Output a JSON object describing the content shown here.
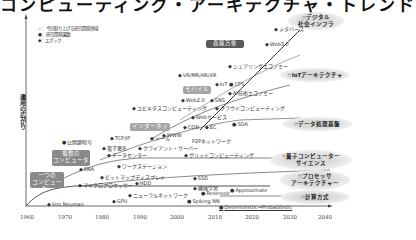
{
  "title": "コンピューティング・アーキテクチャ・トレンド",
  "legend": {
    "star": "☆：今回取り上げる研究開発領域",
    "circle": "●：研究開発課題",
    "diamond": "◆：エポック"
  },
  "yaxis_label": "適用の広がり",
  "xaxis_ticks": [
    "1960",
    "1970",
    "1980",
    "1990",
    "2000",
    "2010",
    "2020",
    "2030",
    "2040"
  ],
  "epoch_boxes": [
    {
      "label": "一つの\nコンピューター"
    },
    {
      "label": "複数の\nコンピューター"
    },
    {
      "label": "インターネット"
    },
    {
      "label": "モバイル"
    },
    {
      "label": "森羅万象"
    }
  ],
  "focus_areas": [
    {
      "label": "☆デジタル\n社会インフラ"
    },
    {
      "label": "☆IoTアーキテクチャ"
    },
    {
      "label": "☆データ処理基盤"
    },
    {
      "label": "☆量子コンピューター\nサイエンス"
    },
    {
      "label": "☆プロセッサ\nアーキテクチャー"
    },
    {
      "label": "☆計算方式"
    }
  ],
  "items": [
    {
      "label": "メタバース"
    },
    {
      "label": "Web3.0"
    },
    {
      "label": "シェアリングエコノミー"
    },
    {
      "label": "VR/MR/AR/XR"
    },
    {
      "label": "IoT"
    },
    {
      "label": "CPS"
    },
    {
      "label": "AI技術エコノミー"
    },
    {
      "label": "Web2.0"
    },
    {
      "label": "SNS"
    },
    {
      "label": "ユビキタスコンピューティング"
    },
    {
      "label": "クラウドコンピューティング"
    },
    {
      "label": "Webサービス"
    },
    {
      "label": "CDN"
    },
    {
      "label": "EC"
    },
    {
      "label": "SOA"
    },
    {
      "label": "WWW"
    },
    {
      "label": "P2Pネットワーク"
    },
    {
      "label": "公開鍵暗号"
    },
    {
      "label": "TCP/IP"
    },
    {
      "label": "メール"
    },
    {
      "label": "電子署名"
    },
    {
      "label": "データセンター"
    },
    {
      "label": "クライアント・サーバー"
    },
    {
      "label": "グリッドコンピューティング"
    },
    {
      "label": "SNA"
    },
    {
      "label": "ワークステーション"
    },
    {
      "label": "ビットマップディスプレイ"
    },
    {
      "label": "HDD"
    },
    {
      "label": "マイクロプロセッサー"
    },
    {
      "label": "ニューラルネットワーク"
    },
    {
      "label": "SSD"
    },
    {
      "label": "機械学習"
    },
    {
      "label": "Reservoir"
    },
    {
      "label": "Approximate"
    },
    {
      "label": "Von Neuman"
    },
    {
      "label": "GPU"
    },
    {
      "label": "Spiking NN"
    },
    {
      "label": "Deterministic⇒Probabilistic"
    }
  ]
}
